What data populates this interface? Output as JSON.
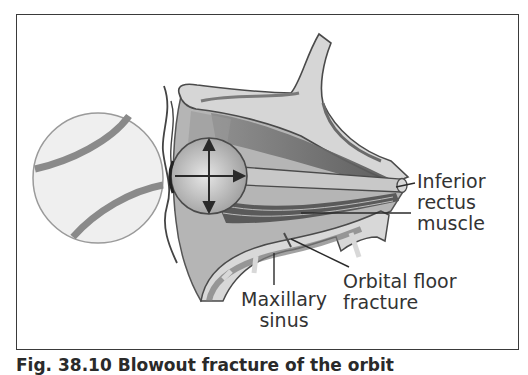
{
  "figure": {
    "labels": {
      "inferior_rectus": [
        "Inferior",
        "rectus",
        "muscle"
      ],
      "orbital_floor": [
        "Orbital floor",
        "fracture"
      ],
      "maxillary_sinus": [
        "Maxillary",
        "sinus"
      ]
    },
    "caption": "Fig. 38.10 Blowout fracture of the orbit"
  },
  "colors": {
    "frame": "#3a3a3a",
    "bone_light": "#d4d4d4",
    "bone_mid": "#a8a8a8",
    "muscle_dark": "#5e5e5e",
    "ball_fill": "#eeeeee",
    "ball_stitch": "#8a8a8a",
    "text": "#333333"
  },
  "icons": {
    "eye_motion_arrows": "four-direction-arrows",
    "baseball": "baseball"
  }
}
